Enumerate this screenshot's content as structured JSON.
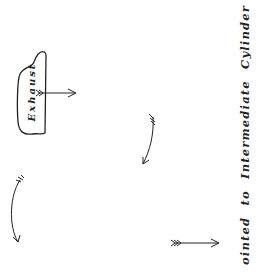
{
  "diagram": {
    "port_label": "Exhaust",
    "caption": "ointed to Intermediate Cylinder",
    "ink_color": "#222222",
    "background": "#ffffff",
    "arrows": [
      {
        "name": "exhaust-outflow-arrow",
        "shape": "straight",
        "direction": "right"
      },
      {
        "name": "middle-curved-arrow",
        "shape": "curved",
        "direction": "down"
      },
      {
        "name": "left-curved-arrow",
        "shape": "curved",
        "direction": "down"
      },
      {
        "name": "bottom-straight-arrow",
        "shape": "straight",
        "direction": "right"
      }
    ]
  }
}
